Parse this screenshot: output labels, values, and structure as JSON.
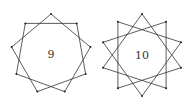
{
  "figures": [
    {
      "label": "9",
      "center": [
        51,
        54
      ],
      "radius": 40,
      "vertices": 9,
      "step": 2,
      "rotation_deg": -90
    },
    {
      "label": "10",
      "center": [
        142,
        55
      ],
      "radius": 41,
      "vertices": 10,
      "step": 3,
      "rotation_deg": -90
    }
  ],
  "colors": {
    "stroke": "#333333",
    "vertex": "#222222",
    "background": "#ffffff"
  }
}
